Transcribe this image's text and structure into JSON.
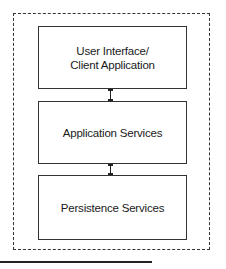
{
  "diagram": {
    "type": "layered-architecture",
    "container": {
      "style": "dashed"
    },
    "layers": [
      {
        "label": "User Interface/\nClient Application"
      },
      {
        "label": "Application Services"
      },
      {
        "label": "Persistence Services"
      }
    ],
    "connectors": [
      {
        "from": "User Interface/ Client Application",
        "to": "Application Services",
        "type": "bidirectional"
      },
      {
        "from": "Application Services",
        "to": "Persistence Services",
        "type": "bidirectional"
      }
    ]
  }
}
